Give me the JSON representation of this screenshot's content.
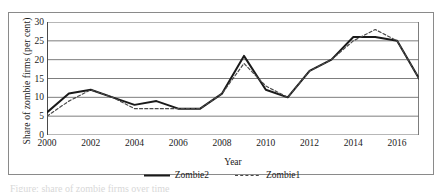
{
  "figure": {
    "caption_partial": "Figure: share of zombie firms over time"
  },
  "chart_data": {
    "type": "line",
    "title": "",
    "xlabel": "Year",
    "ylabel": "Share of zombie firms (per cent)",
    "x": [
      2000,
      2001,
      2002,
      2003,
      2004,
      2005,
      2006,
      2007,
      2008,
      2009,
      2010,
      2011,
      2012,
      2013,
      2014,
      2015,
      2016,
      2017
    ],
    "xlim": [
      2000,
      2017
    ],
    "ylim": [
      0,
      30
    ],
    "xticks": [
      2000,
      2002,
      2004,
      2006,
      2008,
      2010,
      2012,
      2014,
      2016
    ],
    "yticks": [
      0,
      5,
      10,
      15,
      20,
      25,
      30
    ],
    "grid": "horizontal",
    "legend_position": "bottom-center",
    "series": [
      {
        "name": "Zombie2",
        "style": "solid",
        "color": "#1a1a1a",
        "values": [
          6,
          11,
          12,
          10,
          8,
          9,
          7,
          7,
          11,
          21,
          12,
          10,
          17,
          20,
          26,
          26,
          25,
          15
        ]
      },
      {
        "name": "Zombie1",
        "style": "dashed",
        "color": "#4a4a4a",
        "values": [
          5,
          9,
          12,
          10,
          7,
          7,
          7,
          7,
          11,
          19,
          13,
          10,
          17,
          20,
          25,
          28,
          25,
          15
        ]
      }
    ]
  }
}
